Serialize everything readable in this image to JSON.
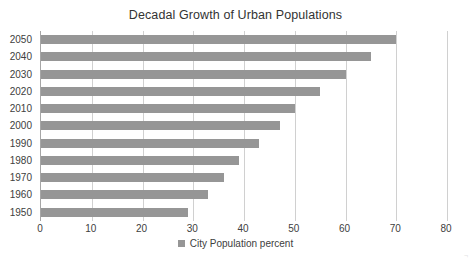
{
  "chart_data": {
    "type": "bar",
    "orientation": "horizontal",
    "title": "Decadal Growth of Urban Populations",
    "xlabel": "",
    "ylabel": "",
    "xlim": [
      0,
      80
    ],
    "xticks": [
      0,
      10,
      20,
      30,
      40,
      50,
      60,
      70,
      80
    ],
    "xtick_labels": [
      "0",
      "10",
      "20",
      "30",
      "40",
      "50",
      "60",
      "70",
      "80"
    ],
    "grid": true,
    "grid_axis": "x",
    "legend": {
      "position": "bottom",
      "entries": [
        {
          "label": "City Population percent",
          "color": "#969696"
        }
      ]
    },
    "categories": [
      "2050",
      "2040",
      "2030",
      "2020",
      "2010",
      "2000",
      "1990",
      "1980",
      "1970",
      "1960",
      "1950"
    ],
    "series": [
      {
        "name": "City Population percent",
        "color": "#969696",
        "values": [
          70,
          65,
          60,
          55,
          50,
          47,
          43,
          39,
          36,
          33,
          29
        ]
      }
    ]
  },
  "style": {
    "bar_color": "#969696",
    "grid_color": "#d0d0d0",
    "axis_color": "#a6a6a6",
    "text_color": "#404040",
    "title_color": "#333333",
    "background": "#ffffff"
  },
  "corner_mark": "¬"
}
